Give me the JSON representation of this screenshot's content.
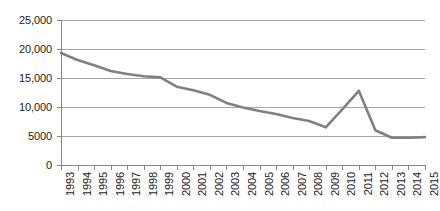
{
  "chart_data": {
    "type": "line",
    "title": "",
    "subtitle": "",
    "xlabel": "",
    "ylabel": "",
    "grid": true,
    "legend": false,
    "legend_position": "none",
    "line_color": "#808080",
    "gridline_color": "#A6A6A6",
    "axis_color": "#868686",
    "text_color": "#1A1A1A",
    "background": "#FFFFFF",
    "xlim": [
      1993,
      2015
    ],
    "ylim": [
      0,
      25000
    ],
    "ytick_labels": [
      "25,000",
      "20,000",
      "15,000",
      "10,000",
      "5000",
      "0"
    ],
    "ytick_values": [
      25000,
      20000,
      15000,
      10000,
      5000,
      0
    ],
    "xtick_labels": [
      "1993",
      "1994",
      "1995",
      "1996",
      "1997",
      "1998",
      "1999",
      "2000",
      "2001",
      "2002",
      "2003",
      "2004",
      "2005",
      "2006",
      "2007",
      "2008",
      "2009",
      "2010",
      "2011",
      "2012",
      "2013",
      "2014",
      "2015"
    ],
    "categories": [
      1993,
      1994,
      1995,
      1996,
      1997,
      1998,
      1999,
      2000,
      2001,
      2002,
      2003,
      2004,
      2005,
      2006,
      2007,
      2008,
      2009,
      2010,
      2011,
      2012,
      2013,
      2014,
      2015
    ],
    "series": [
      {
        "name": "series-1",
        "color": "#808080",
        "values": [
          19300,
          18100,
          17200,
          16200,
          15700,
          15300,
          15100,
          13500,
          12900,
          12100,
          10700,
          9900,
          9300,
          8800,
          8100,
          7600,
          6500,
          9600,
          12800,
          6000,
          4700,
          4700,
          4800
        ]
      }
    ]
  }
}
